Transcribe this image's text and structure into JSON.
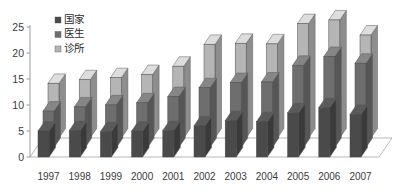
{
  "chart_data": {
    "type": "bar",
    "title": "",
    "subtitle": "",
    "xlabel": "",
    "ylabel": "",
    "grid": false,
    "legend_position": "top-left",
    "categories": [
      "1997",
      "1998",
      "1999",
      "2000",
      "2001",
      "2002",
      "2003",
      "2004",
      "2005",
      "2006",
      "2007"
    ],
    "yticks": [
      0,
      5,
      10,
      15,
      20,
      25
    ],
    "ylim": [
      0,
      25
    ],
    "series": [
      {
        "name": "国家",
        "color": "#4a4a4a",
        "values": [
          5.0,
          5.1,
          4.9,
          5.0,
          5.1,
          6.0,
          7.0,
          6.8,
          8.5,
          9.5,
          8.2
        ]
      },
      {
        "name": "医生",
        "color": "#6e6e6e",
        "values": [
          7.0,
          7.8,
          8.2,
          8.6,
          9.8,
          11.5,
          12.5,
          12.6,
          15.8,
          17.5,
          16.2
        ]
      },
      {
        "name": "诊所",
        "color": "#b5b5b5",
        "values": [
          10.5,
          11.2,
          11.6,
          12.2,
          13.8,
          18.0,
          18.2,
          18.1,
          22.0,
          22.7,
          19.8
        ]
      }
    ]
  },
  "legend": {
    "items": [
      {
        "label": "国家",
        "color": "#4a4a4a"
      },
      {
        "label": "医生",
        "color": "#6e6e6e"
      },
      {
        "label": "诊所",
        "color": "#b5b5b5"
      }
    ]
  },
  "axis": {
    "y_tick_labels": [
      "0",
      "5",
      "10",
      "15",
      "20",
      "25"
    ],
    "x_tick_labels": [
      "1997",
      "1998",
      "1999",
      "2000",
      "2001",
      "2002",
      "2003",
      "2004",
      "2005",
      "2006",
      "2007"
    ]
  }
}
